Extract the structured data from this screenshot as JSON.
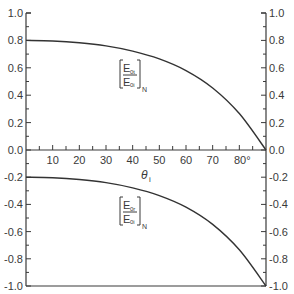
{
  "chart_data": [
    {
      "type": "line",
      "title": "",
      "label_main": "E",
      "label_num_sub": "0t",
      "label_den_sub": "0i",
      "label_outer_sub": "N",
      "xlabel": "θi",
      "ylabel": "",
      "xlim": [
        0,
        90
      ],
      "ylim": [
        0.0,
        1.0
      ],
      "yticks": [
        "0.0",
        "0.2",
        "0.4",
        "0.6",
        "0.8",
        "1.0"
      ],
      "x": [
        0,
        10,
        20,
        30,
        40,
        50,
        60,
        70,
        80,
        90
      ],
      "series": [
        {
          "name": "[E0t/E0i]N",
          "values": [
            0.8,
            0.796,
            0.783,
            0.76,
            0.722,
            0.665,
            0.58,
            0.453,
            0.266,
            0.0
          ]
        }
      ]
    },
    {
      "type": "line",
      "title": "",
      "label_main": "E",
      "label_num_sub": "0r",
      "label_den_sub": "0i",
      "label_outer_sub": "N",
      "xlabel": "θi",
      "ylabel": "",
      "xlim": [
        0,
        90
      ],
      "ylim": [
        -1.0,
        0.0
      ],
      "yticks": [
        "-0.2",
        "-0.4",
        "-0.6",
        "-0.8",
        "-1.0"
      ],
      "x": [
        0,
        10,
        20,
        30,
        40,
        50,
        60,
        70,
        80,
        90
      ],
      "series": [
        {
          "name": "[E0r/E0i]N",
          "values": [
            -0.2,
            -0.204,
            -0.217,
            -0.24,
            -0.278,
            -0.335,
            -0.42,
            -0.547,
            -0.734,
            -1.0
          ]
        }
      ]
    }
  ],
  "x_axis": {
    "tick_labels": [
      "10",
      "20",
      "30",
      "40",
      "50",
      "60",
      "70",
      "80°"
    ],
    "tick_values": [
      10,
      20,
      30,
      40,
      50,
      60,
      70,
      80
    ],
    "label_main": "θ",
    "label_sub": "i"
  },
  "colors": {
    "ink": "#333333",
    "background": "#ffffff"
  }
}
